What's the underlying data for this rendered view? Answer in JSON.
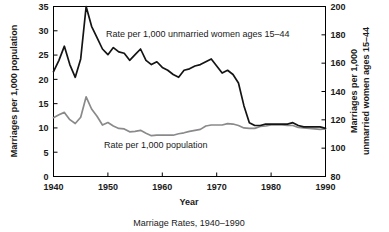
{
  "chart_data": {
    "type": "line",
    "title": "Marriage Rates, 1940–1990",
    "xlabel": "Year",
    "ylabel": "Marriages per 1,000 population",
    "ylabel_right": "Marriages per 1,000 unmarried women ages 15–44",
    "xlim": [
      1940,
      1990
    ],
    "ylim": [
      0,
      35
    ],
    "ylim_right": [
      80,
      200
    ],
    "xticks": [
      1940,
      1950,
      1960,
      1970,
      1980,
      1990
    ],
    "xticklabels": [
      "1940",
      "1950",
      "1960",
      "1970",
      "1980",
      "1990"
    ],
    "yticks": [
      0,
      5,
      10,
      15,
      20,
      25,
      30,
      35
    ],
    "yticklabels": [
      "0",
      "5",
      "10",
      "15",
      "20",
      "25",
      "30",
      "35"
    ],
    "yticks_right": [
      80,
      100,
      120,
      140,
      160,
      180,
      200
    ],
    "yticklabels_right": [
      "80",
      "100",
      "120",
      "140",
      "160",
      "180",
      "200"
    ],
    "grid": false,
    "legend_position": "inline-annotations",
    "x": [
      1940,
      1941,
      1942,
      1943,
      1944,
      1945,
      1946,
      1947,
      1948,
      1949,
      1950,
      1951,
      1952,
      1953,
      1954,
      1955,
      1956,
      1957,
      1958,
      1959,
      1960,
      1961,
      1962,
      1963,
      1964,
      1965,
      1966,
      1967,
      1968,
      1969,
      1970,
      1971,
      1972,
      1973,
      1974,
      1975,
      1976,
      1977,
      1978,
      1979,
      1980,
      1981,
      1982,
      1983,
      1984,
      1985,
      1986,
      1987,
      1988,
      1989,
      1990
    ],
    "series": [
      {
        "name": "Rate per 1,000 unmarried women ages 15–44",
        "axis": "right",
        "units": "marriages per 1,000 unmarried women ages 15-44",
        "color": "#141414",
        "values": [
          154,
          162,
          172,
          159,
          150,
          163,
          200,
          186,
          178,
          170,
          166,
          171,
          168,
          167,
          162,
          166,
          170,
          162,
          159,
          161,
          157,
          155,
          152,
          150,
          155,
          156,
          158,
          159,
          161,
          163,
          158,
          153,
          155,
          152,
          146,
          130,
          118,
          116,
          116,
          117,
          117,
          117,
          117,
          117,
          118,
          116,
          115,
          115,
          115,
          115,
          114
        ]
      },
      {
        "name": "Rate per 1,000 population",
        "axis": "left",
        "units": "marriages per 1,000 population",
        "color": "#8a8a8a",
        "values": [
          12.1,
          12.7,
          13.2,
          11.7,
          10.9,
          12.2,
          16.4,
          13.9,
          12.4,
          10.6,
          11.1,
          10.4,
          9.9,
          9.8,
          9.2,
          9.3,
          9.5,
          8.9,
          8.4,
          8.5,
          8.5,
          8.5,
          8.5,
          8.8,
          9.0,
          9.3,
          9.5,
          9.7,
          10.4,
          10.6,
          10.6,
          10.6,
          10.9,
          10.8,
          10.5,
          10.0,
          9.9,
          9.9,
          10.3,
          10.4,
          10.6,
          10.6,
          10.6,
          10.5,
          10.5,
          10.1,
          10.0,
          9.9,
          9.8,
          9.7,
          9.8
        ]
      }
    ],
    "annotations": [
      {
        "name": "unmarried-women-label",
        "text": "Rate per 1,000 unmarried women ages 15–44",
        "x_px": 106,
        "y_px": 37
      },
      {
        "name": "population-label",
        "text": "Rate per 1,000 population",
        "x_px": 104,
        "y_px": 148
      }
    ]
  },
  "labels": {
    "y_left_title": "Marriages per 1,000 population",
    "y_right_title_line1": "Marriages per 1,000",
    "y_right_title_line2": "unmarried women ages 15–44",
    "x_title": "Year",
    "caption": "Marriage Rates, 1940–1990"
  }
}
